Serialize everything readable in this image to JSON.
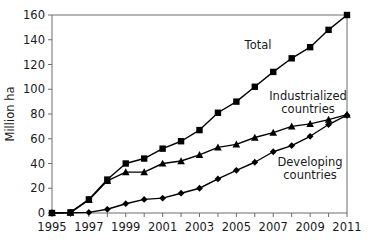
{
  "chart_data": {
    "type": "line",
    "title": "",
    "subtitle": "",
    "xlabel": "",
    "ylabel": "Million ha",
    "xlim": [
      1995,
      2011
    ],
    "ylim": [
      0,
      160
    ],
    "ytick_step": 20,
    "xtick_step": 2,
    "grid": false,
    "legend_position": "inline-annotations",
    "x": [
      1995,
      1996,
      1997,
      1998,
      1999,
      2000,
      2001,
      2002,
      2003,
      2004,
      2005,
      2006,
      2007,
      2008,
      2009,
      2010,
      2011
    ],
    "xtick_labels": [
      "1995",
      "1997",
      "1999",
      "2001",
      "2003",
      "2005",
      "2007",
      "2009",
      "2011"
    ],
    "ytick_labels": [
      "0",
      "20",
      "40",
      "60",
      "80",
      "100",
      "120",
      "140",
      "160"
    ],
    "series": [
      {
        "name": "Total",
        "marker": "square",
        "label_text": "Total",
        "values": [
          0,
          0.5,
          11,
          27,
          40,
          44,
          52,
          58,
          67,
          81,
          90,
          102,
          114,
          125,
          134,
          148,
          160
        ]
      },
      {
        "name": "Industrialized countries",
        "marker": "triangle",
        "label_text": "Industrialized\ncountries",
        "label_line1": "Industrialized",
        "label_line2": "countries",
        "values": [
          0,
          0.3,
          10.5,
          26,
          33,
          33,
          40,
          42,
          47,
          53,
          55.5,
          61,
          65,
          70,
          72,
          75.5,
          79.5
        ]
      },
      {
        "name": "Developing countries",
        "marker": "diamond",
        "label_text": "Developing\ncountries",
        "label_line1": "Developing",
        "label_line2": "countries",
        "values": [
          0,
          0.2,
          0.5,
          3,
          7.5,
          11,
          12,
          16,
          20,
          27.5,
          34.5,
          41,
          49.5,
          54.5,
          62,
          71.5,
          79
        ]
      }
    ],
    "colors": {
      "line": "#000000",
      "marker": "#000000",
      "axis": "#6d6d6d",
      "text": "#1a1a1a",
      "background": "#ffffff"
    },
    "annotations": [
      {
        "name": "total-label",
        "text": "Total"
      },
      {
        "name": "industrialized-label-line1",
        "text": "Industrialized"
      },
      {
        "name": "industrialized-label-line2",
        "text": "countries"
      },
      {
        "name": "developing-label-line1",
        "text": "Developing"
      },
      {
        "name": "developing-label-line2",
        "text": "countries"
      }
    ]
  }
}
